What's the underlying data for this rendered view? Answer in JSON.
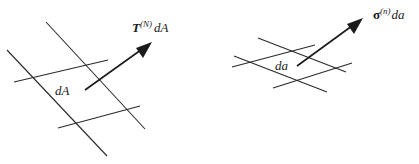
{
  "figures": [
    {
      "name": "reference-configuration",
      "area_label": "dA",
      "vector_label": {
        "symbol": "T",
        "superscript": "(N)",
        "suffix": "dA"
      }
    },
    {
      "name": "current-configuration",
      "area_label": "da",
      "vector_label": {
        "symbol": "σ",
        "superscript": "(n)",
        "suffix": "da"
      }
    }
  ],
  "colors": {
    "line": "#2a2a2a",
    "arrow": "#1a1a1a",
    "background": "#ffffff"
  }
}
